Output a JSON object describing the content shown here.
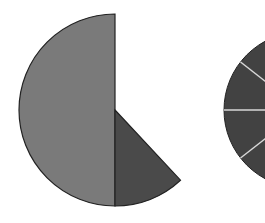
{
  "chart_data": [
    {
      "type": "pie",
      "title": "",
      "note": "Partial pie: a missing (blank) sector remains unfilled",
      "center": [
        115,
        110
      ],
      "radius": 96,
      "slices": [
        {
          "label": "",
          "percent": 50,
          "start_deg": 180,
          "end_deg": 360,
          "color": "#7a7a7a"
        },
        {
          "label": "",
          "percent": 12,
          "start_deg": 137,
          "end_deg": 180,
          "color": "#4a4a4a"
        },
        {
          "label": "(blank)",
          "percent": 38,
          "start_deg": 0,
          "end_deg": 137,
          "color": "#ffffff"
        }
      ],
      "legend": []
    },
    {
      "type": "pie",
      "title": "",
      "note": "Second pie cropped at right edge; dark fill with white divider lines",
      "center": [
        302,
        110
      ],
      "radius": 78,
      "fill": "#424242",
      "divider_color": "#d8d8d8",
      "divider_angles_deg": [
        232,
        270,
        308
      ],
      "legend": []
    }
  ],
  "colors": {
    "background": "#ffffff",
    "outline": "#222222"
  }
}
